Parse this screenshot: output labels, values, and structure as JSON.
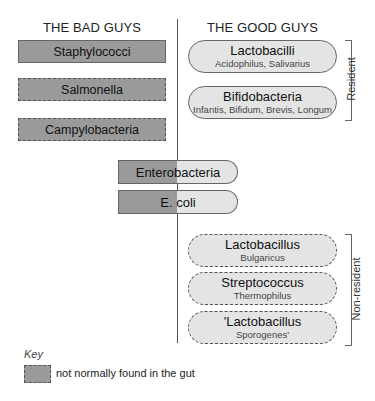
{
  "headings": {
    "bad": "THE BAD GUYS",
    "good": "THE GOOD GUYS"
  },
  "bad_guys": [
    {
      "name": "Staphylococci",
      "not_normally_in_gut": false
    },
    {
      "name": "Salmonella",
      "not_normally_in_gut": true
    },
    {
      "name": "Campylobacteria",
      "not_normally_in_gut": true
    }
  ],
  "mixed": [
    {
      "name": "Enterobacteria",
      "left_part": "Entero",
      "right_part": "bacteria"
    },
    {
      "name": "E. coli",
      "left_part": "E.",
      "right_part": "coli"
    }
  ],
  "resident": {
    "label": "Resident",
    "items": [
      {
        "title": "Lactobacilli",
        "subtitle": "Acidophilus, Salivarius"
      },
      {
        "title": "Bifidobacteria",
        "subtitle": "Infantis, Bifidum, Brevis, Longum"
      }
    ]
  },
  "non_resident": {
    "label": "Non-resident",
    "items": [
      {
        "title": "Lactobacillus",
        "subtitle": "Bulgaricus"
      },
      {
        "title": "Streptococcus",
        "subtitle": "Thermophilus"
      },
      {
        "title": "'Lactobacillus",
        "subtitle": "Sporogenes'"
      }
    ]
  },
  "key": {
    "title": "Key",
    "entry": "not normally found in the gut"
  },
  "colors": {
    "bad_fill": "#9a9a9a",
    "good_fill": "#e4e4e4",
    "border": "#666666"
  }
}
